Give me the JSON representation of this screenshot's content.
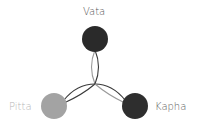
{
  "diagram": {
    "nodes": [
      {
        "id": "vata",
        "label": "Vata",
        "color": "#2a2a2a",
        "cx": 95,
        "cy": 39,
        "r": 13
      },
      {
        "id": "pitta",
        "label": "Pitta",
        "color": "#a3a3a3",
        "cx": 54,
        "cy": 106,
        "r": 13
      },
      {
        "id": "kapha",
        "label": "Kapha",
        "color": "#2e2e2e",
        "cx": 135,
        "cy": 106,
        "r": 13
      }
    ],
    "center": {
      "x": 95,
      "y": 84
    },
    "connectors": [
      {
        "from": "vata",
        "to": "center",
        "style": "double-arc"
      },
      {
        "from": "pitta",
        "to": "center",
        "style": "double-arc"
      },
      {
        "from": "kapha",
        "to": "center",
        "style": "double-arc"
      }
    ],
    "line_colors": {
      "dark": "#3a3a3a",
      "light": "#9a9a9a"
    }
  }
}
